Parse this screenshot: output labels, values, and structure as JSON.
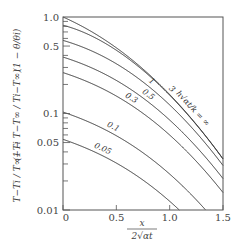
{
  "chart_data": {
    "type": "line",
    "title": "",
    "xlabel": "x / (2√(αt))",
    "ylabel": "(T − Ti)/(T∞ − Ti) = (1 − (T − T∞)/(Ti − T∞)) = (1 − θ/θi)",
    "xlim": [
      0,
      1.5
    ],
    "ylim": [
      0.01,
      1.0
    ],
    "yscale": "log",
    "grid": false,
    "x_ticks": [
      0,
      0.5,
      1.0,
      1.5
    ],
    "x_tick_labels": [
      "0",
      "0.5",
      "1.0",
      "1.5"
    ],
    "y_ticks": [
      0.01,
      0.05,
      0.1,
      0.5,
      1.0
    ],
    "y_tick_labels": [
      "0.01",
      "0.05",
      "0.1",
      "0.5",
      "1.0"
    ],
    "parameter_label": "h√(αt)/k",
    "series": [
      {
        "name": "∞",
        "H": 1000,
        "label": "h√(αt)/k = ∞",
        "values_at_x0": 1.0
      },
      {
        "name": "3",
        "H": 3,
        "label": "3",
        "values_at_x0": 0.83
      },
      {
        "name": "1",
        "H": 1,
        "label": "1",
        "values_at_x0": 0.57
      },
      {
        "name": "0.5",
        "H": 0.5,
        "label": "0.5",
        "values_at_x0": 0.38
      },
      {
        "name": "0.3",
        "H": 0.3,
        "label": "0.3",
        "values_at_x0": 0.26
      },
      {
        "name": "0.1",
        "H": 0.1,
        "label": "0.1",
        "values_at_x0": 0.1
      },
      {
        "name": "0.05",
        "H": 0.05,
        "label": "0.05",
        "values_at_x0": 0.05
      }
    ]
  },
  "labels": {
    "y_axis_left": "T−Ti / T∞−Ti",
    "y_axis_mid": "(1 − T−T∞ / Ti−T∞)",
    "y_axis_right": "(1 − θ/θi)",
    "x_axis_num": "x",
    "x_axis_den": "2√αt",
    "param": "h√αt/k = ∞"
  },
  "colors": {
    "line": "#333333",
    "frame": "#555555",
    "text": "#444444"
  }
}
